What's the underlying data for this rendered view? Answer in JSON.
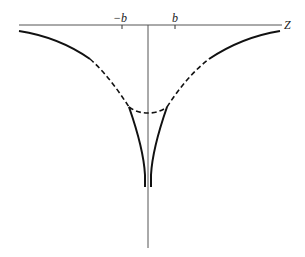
{
  "diagram": {
    "axis_label": "Z",
    "tick_labels": {
      "neg_b": "−b",
      "pos_b": "b"
    },
    "curves": [
      {
        "name": "outer-left",
        "style": "solid then dashed"
      },
      {
        "name": "outer-right",
        "style": "dashed then solid"
      },
      {
        "name": "bottom-arc",
        "style": "dashed"
      },
      {
        "name": "inner-cusp-left",
        "style": "solid"
      },
      {
        "name": "inner-cusp-right",
        "style": "solid"
      }
    ]
  }
}
